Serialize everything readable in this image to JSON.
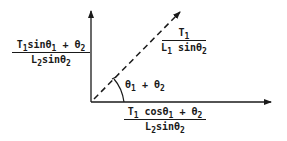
{
  "diagram": {
    "colors": {
      "ink": "#1a1a1a",
      "background": "#ffffff"
    },
    "axes": {
      "origin": [
        91,
        102
      ],
      "vertical_axis_tip": [
        91,
        10
      ],
      "horizontal_axis_tip": [
        271,
        102
      ]
    },
    "resultant_vector": {
      "style": "dashed",
      "from": [
        91,
        102
      ],
      "to": [
        180,
        12
      ]
    },
    "angle_label": {
      "base": "θ",
      "sub1": "1",
      "plus": " + ",
      "base2": "θ",
      "sub2": "2"
    },
    "vertical_component": {
      "numerator": {
        "t": "T",
        "t_sub": "1",
        "sin": "sinθ",
        "sin_sub": "1",
        "plus": " + θ",
        "plus_sub": "2"
      },
      "denominator": {
        "l": "L",
        "l_sub": "2",
        "sin": "sinθ",
        "sin_sub": "2"
      }
    },
    "vector_magnitude": {
      "numerator": {
        "t": "T",
        "t_sub": "1"
      },
      "denominator": {
        "l": "L",
        "l_sub": "1",
        "sin": " sinθ",
        "sin_sub": "2"
      }
    },
    "horizontal_component": {
      "numerator": {
        "t": "T",
        "t_sub": "1",
        "cos": " cosθ",
        "cos_sub": "1",
        "plus": " + θ",
        "plus_sub": "2"
      },
      "denominator": {
        "l": "L",
        "l_sub": "2",
        "sin": "sinθ",
        "sin_sub": "2"
      }
    }
  }
}
